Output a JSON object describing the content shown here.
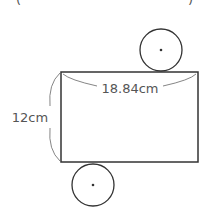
{
  "diagram": {
    "type": "cylinder-net",
    "colors": {
      "stroke": "#333333",
      "label": "#555555",
      "background": "#ffffff"
    },
    "rectangle": {
      "width_label": "18.84cm",
      "height_label": "12cm"
    },
    "circles": [
      {
        "position": "top",
        "has_center_dot": true
      },
      {
        "position": "bottom",
        "has_center_dot": true
      }
    ],
    "edge_marks": {
      "left": "(",
      "right": ")"
    }
  }
}
